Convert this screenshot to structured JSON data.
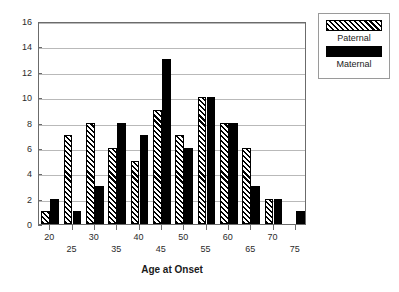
{
  "chart_data": {
    "type": "bar",
    "title": "",
    "xlabel": "Age at Onset",
    "ylabel": "",
    "categories": [
      "20",
      "25",
      "30",
      "35",
      "40",
      "45",
      "50",
      "55",
      "60",
      "65",
      "70",
      "75"
    ],
    "series": [
      {
        "name": "Paternal",
        "pattern": "hatched-diagonal",
        "color": "#000000",
        "values": [
          1,
          7,
          8,
          6,
          5,
          9,
          7,
          10,
          8,
          6,
          2,
          0
        ]
      },
      {
        "name": "Maternal",
        "pattern": "solid",
        "color": "#000000",
        "values": [
          2,
          1,
          3,
          8,
          7,
          13,
          6,
          10,
          8,
          3,
          2,
          1
        ]
      }
    ],
    "ylim": [
      0,
      16
    ],
    "yticks": [
      0,
      2,
      4,
      6,
      8,
      10,
      12,
      14,
      16
    ],
    "ytick_labels": [
      "0",
      "2",
      "4",
      "6",
      "8",
      "10",
      "12",
      "14",
      "16"
    ],
    "grid": true,
    "grid_axis": "y",
    "legend_position": "outside-top-right",
    "legend_entries": [
      "Paternal",
      "Maternal"
    ],
    "xtick_label_rows": [
      0,
      1,
      0,
      1,
      0,
      1,
      0,
      1,
      0,
      1,
      0,
      1
    ]
  },
  "legend": {
    "paternal_label": "Paternal",
    "maternal_label": "Maternal"
  },
  "axis": {
    "x_title": "Age at Onset"
  },
  "colors": {
    "bar_fill": "#000000",
    "grid": "#b9b9b9",
    "frame": "#6b6b6b",
    "text": "#1a1a1a",
    "background": "#ffffff"
  }
}
